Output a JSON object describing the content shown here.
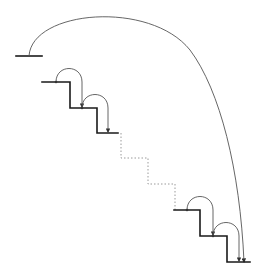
{
  "diagram": {
    "title": "",
    "colors": {
      "steps": "#1a1a1a",
      "arcs": "#555555",
      "ellipsis": "#9a9a9a"
    },
    "elements": {
      "top_ledge": "top-ledge",
      "upper_steps": 2,
      "elided_steps": 2,
      "lower_steps": 2,
      "small_arcs": 4,
      "long_arc": 1
    }
  }
}
